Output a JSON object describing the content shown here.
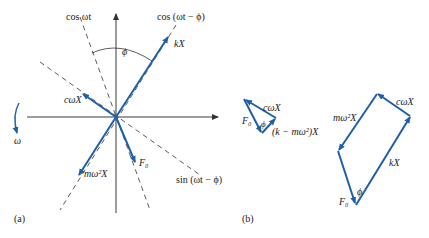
{
  "figure": {
    "panel_a": {
      "caption": "(a)",
      "labels": {
        "cos_wt": "cos ωt",
        "cos_wt_phi": "cos (ωt − ϕ)",
        "sin_wt_phi": "sin (ωt − ϕ)",
        "phi": "ϕ",
        "kX": "kX",
        "cwX": "cωX",
        "mw2X": "mω²X",
        "F0": "F₀",
        "omega": "ω"
      }
    },
    "panel_b": {
      "caption": "(b)",
      "triangle": {
        "cwX": "cωX",
        "F0": "F₀",
        "phi": "ϕ",
        "k_minus_mw2_X": "(k − mω²)X"
      },
      "parallelogram": {
        "cwX": "cωX",
        "mw2X": "mω²X",
        "kX": "kX",
        "phi": "ϕ",
        "F0": "F₀"
      }
    },
    "colors": {
      "vector": "#1f5fa6",
      "axis": "#3a3a3a",
      "text": "#222222"
    }
  }
}
